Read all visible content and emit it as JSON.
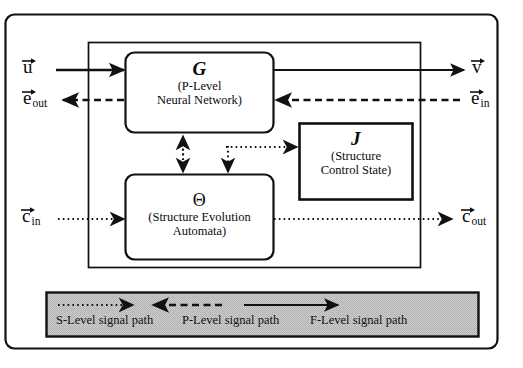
{
  "figure": {
    "kind": "block-diagram",
    "background": "#ffffff",
    "line_color": "#111111",
    "legend_fill": "#c9c9c9"
  },
  "blocks": [
    {
      "id": "G",
      "symbol": "G",
      "symbol_style": "bold-italic",
      "caption_line1": "(P-Level",
      "caption_line2": "Neural Network)",
      "corner": "rounded"
    },
    {
      "id": "J",
      "symbol": "J",
      "symbol_style": "bold-italic",
      "caption_line1": "(Structure",
      "caption_line2": "Control State)",
      "corner": "square"
    },
    {
      "id": "Theta",
      "symbol": "Θ",
      "symbol_style": "plain",
      "caption_line1": "(Structure Evolution",
      "caption_line2": "Automata)",
      "corner": "rounded"
    }
  ],
  "ports": {
    "u": {
      "base": "u",
      "sub": "",
      "side": "left",
      "signal": "F-Level"
    },
    "e_out": {
      "base": "e",
      "sub": "out",
      "side": "left",
      "signal": "P-Level"
    },
    "c_in": {
      "base": "c",
      "sub": "in",
      "side": "left",
      "signal": "S-Level"
    },
    "v": {
      "base": "v",
      "sub": "",
      "side": "right",
      "signal": "F-Level"
    },
    "e_in": {
      "base": "e",
      "sub": "in",
      "side": "right",
      "signal": "P-Level"
    },
    "c_out": {
      "base": "c",
      "sub": "out",
      "side": "right",
      "signal": "S-Level"
    }
  },
  "legend": {
    "entries": [
      {
        "label": "S-Level signal path",
        "style": "dotted",
        "direction": "right"
      },
      {
        "label": "P-Level signal path",
        "style": "dashed",
        "direction": "left"
      },
      {
        "label": "F-Level  signal path",
        "style": "solid",
        "direction": "right"
      }
    ]
  }
}
